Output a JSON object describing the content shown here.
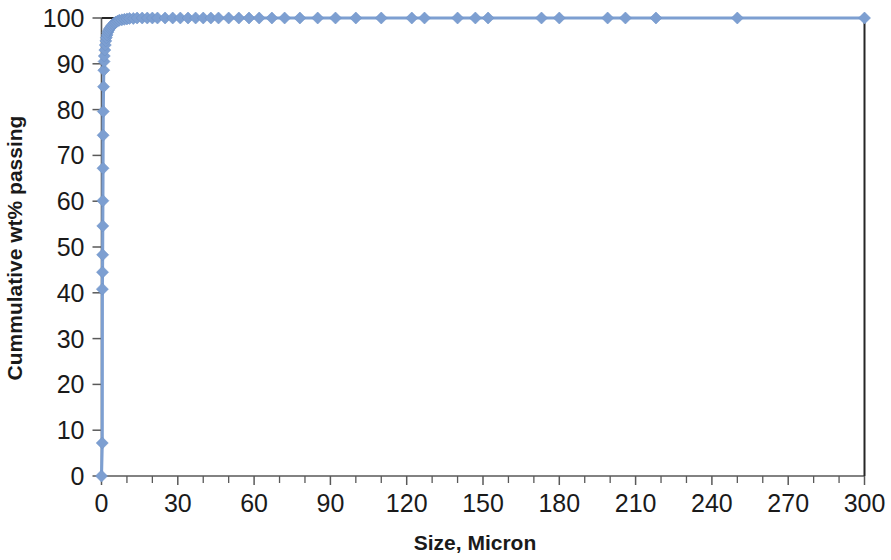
{
  "chart_data": {
    "type": "line",
    "title": "",
    "subtitle": "",
    "xlabel": "Size, Micron",
    "ylabel": "Cummulative wt% passing",
    "xlim": [
      0,
      300
    ],
    "ylim": [
      0,
      100
    ],
    "x_ticks": [
      0,
      30,
      60,
      90,
      120,
      150,
      180,
      210,
      240,
      270,
      300
    ],
    "x_tick_labels": [
      "0",
      "30",
      "60",
      "90",
      "120",
      "150",
      "180",
      "210",
      "240",
      "270",
      "300"
    ],
    "x_minor_tick_step": 10,
    "y_ticks": [
      0,
      10,
      20,
      30,
      40,
      50,
      60,
      70,
      80,
      90,
      100
    ],
    "y_tick_labels": [
      "0",
      "10",
      "20",
      "30",
      "40",
      "50",
      "60",
      "70",
      "80",
      "90",
      "100"
    ],
    "grid": false,
    "legend": false,
    "legend_position": "none",
    "marker": "diamond",
    "marker_size": 9,
    "series_color": "#7d9fd1",
    "axis_color": "#595959",
    "text_color": "#1a1a1a",
    "background": "#ffffff",
    "series": [
      {
        "name": "Cumulative passing",
        "x": [
          0.0,
          0.3,
          0.35,
          0.4,
          0.45,
          0.5,
          0.55,
          0.6,
          0.65,
          0.7,
          0.8,
          0.9,
          1.0,
          1.1,
          1.3,
          1.5,
          1.7,
          1.9,
          2.2,
          2.5,
          2.8,
          3.2,
          3.6,
          4.0,
          4.5,
          5.0,
          5.6,
          6.3,
          7.0,
          8.0,
          9.0,
          10.0,
          11.0,
          12.5,
          14.0,
          16.0,
          18.0,
          20.0,
          22.0,
          25.0,
          28.0,
          31.0,
          34.0,
          37.0,
          40.0,
          43.0,
          46.0,
          50.0,
          54.0,
          58.0,
          62.0,
          67.0,
          72.0,
          78.0,
          85.0,
          92.0,
          100.0,
          110.0,
          122.0,
          127.0,
          140.0,
          147.0,
          152.0,
          173.0,
          180.0,
          199.0,
          206.0,
          218.0,
          250.0,
          300.0
        ],
        "y": [
          0.0,
          7.2,
          40.8,
          44.5,
          48.3,
          54.6,
          60.1,
          67.2,
          74.4,
          79.6,
          85.0,
          88.6,
          90.5,
          91.7,
          93.0,
          94.1,
          95.0,
          95.7,
          96.3,
          96.9,
          97.3,
          97.7,
          98.0,
          98.3,
          98.6,
          98.9,
          99.1,
          99.3,
          99.5,
          99.6,
          99.7,
          99.8,
          99.9,
          99.9,
          100.0,
          100.0,
          100.0,
          100.0,
          100.0,
          100.0,
          100.0,
          100.0,
          100.0,
          100.0,
          100.0,
          100.0,
          100.0,
          100.0,
          100.0,
          100.0,
          100.0,
          100.0,
          100.0,
          100.0,
          100.0,
          100.0,
          100.0,
          100.0,
          100.0,
          100.0,
          100.0,
          100.0,
          100.0,
          100.0,
          100.0,
          100.0,
          100.0,
          100.0,
          100.0,
          100.0
        ]
      }
    ]
  }
}
